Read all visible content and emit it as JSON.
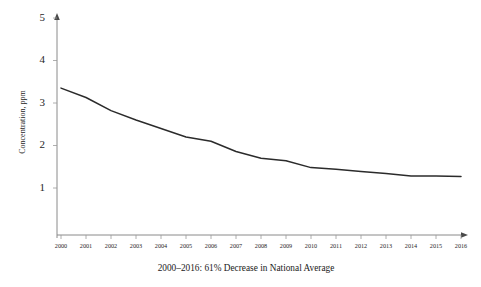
{
  "chart_data": {
    "type": "line",
    "title": "",
    "subtitle": "",
    "caption": "2000–2016:  61% Decrease in National Average",
    "xlabel": "",
    "ylabel": "Concentration, ppm",
    "grid": false,
    "legend": false,
    "legend_position": "none",
    "line_color": "#2b2b2b",
    "axis_color": "#8a8a8a",
    "background_color": "#ffffff",
    "xlim": [
      2000,
      2016
    ],
    "ylim": [
      0,
      5
    ],
    "yticks": [
      1,
      2,
      3,
      4,
      5
    ],
    "ytick_labels": [
      "1",
      "2",
      "3",
      "4",
      "5"
    ],
    "categories": [
      "2000",
      "2001",
      "2002",
      "2003",
      "2004",
      "2005",
      "2006",
      "2007",
      "2008",
      "2009",
      "2010",
      "2011",
      "2012",
      "2013",
      "2014",
      "2015",
      "2016"
    ],
    "x": [
      2000,
      2001,
      2002,
      2003,
      2004,
      2005,
      2006,
      2007,
      2008,
      2009,
      2010,
      2011,
      2012,
      2013,
      2014,
      2015,
      2016
    ],
    "values": [
      3.35,
      3.13,
      2.82,
      2.6,
      2.4,
      2.2,
      2.1,
      1.86,
      1.7,
      1.64,
      1.48,
      1.44,
      1.39,
      1.34,
      1.28,
      1.28,
      1.27
    ],
    "series": [
      {
        "name": "National Average Concentration",
        "values": [
          3.35,
          3.13,
          2.82,
          2.6,
          2.4,
          2.2,
          2.1,
          1.86,
          1.7,
          1.64,
          1.48,
          1.44,
          1.39,
          1.34,
          1.28,
          1.28,
          1.27
        ]
      }
    ],
    "annotations": []
  }
}
